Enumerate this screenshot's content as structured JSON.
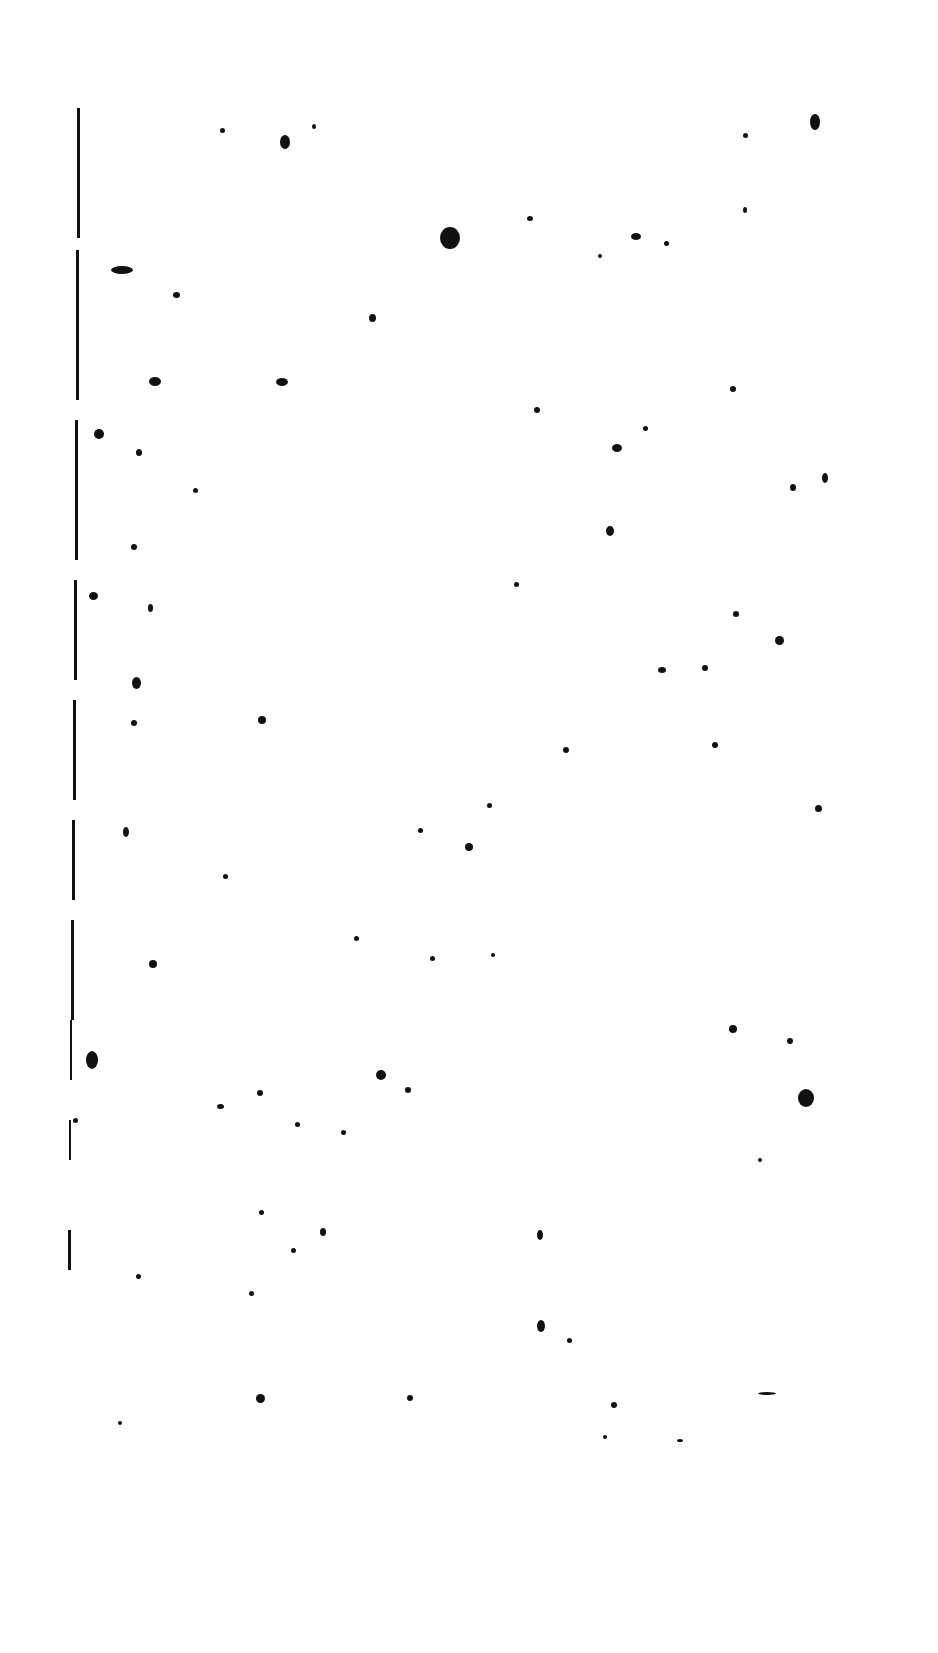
{
  "page": {
    "type": "blank scanned page",
    "text": "",
    "background": "#ffffff",
    "ink": "#111111"
  },
  "edge_segments": [
    [
      77,
      108,
      3,
      130
    ],
    [
      76,
      250,
      3,
      150
    ],
    [
      75,
      420,
      3,
      140
    ],
    [
      74,
      580,
      3,
      100
    ],
    [
      73,
      700,
      3,
      100
    ],
    [
      72,
      820,
      3,
      80
    ],
    [
      71,
      920,
      3,
      100
    ],
    [
      70,
      1020,
      2,
      60
    ],
    [
      69,
      1120,
      2,
      40
    ],
    [
      68,
      1230,
      3,
      40
    ]
  ],
  "dots": [
    [
      285,
      142,
      10,
      14
    ],
    [
      450,
      238,
      20,
      22
    ],
    [
      815,
      122,
      10,
      16
    ],
    [
      122,
      270,
      22,
      8
    ],
    [
      176,
      295,
      7,
      6
    ],
    [
      372,
      318,
      7,
      8
    ],
    [
      222,
      130,
      5,
      5
    ],
    [
      314,
      126,
      4,
      5
    ],
    [
      530,
      218,
      6,
      5
    ],
    [
      636,
      236,
      10,
      7
    ],
    [
      666,
      243,
      5,
      5
    ],
    [
      600,
      256,
      4,
      4
    ],
    [
      745,
      135,
      5,
      5
    ],
    [
      745,
      210,
      4,
      6
    ],
    [
      155,
      381,
      12,
      9
    ],
    [
      282,
      382,
      12,
      8
    ],
    [
      99,
      434,
      10,
      10
    ],
    [
      139,
      452,
      6,
      7
    ],
    [
      195,
      490,
      5,
      5
    ],
    [
      617,
      448,
      10,
      8
    ],
    [
      537,
      410,
      6,
      6
    ],
    [
      645,
      428,
      5,
      5
    ],
    [
      733,
      389,
      6,
      6
    ],
    [
      793,
      487,
      6,
      7
    ],
    [
      825,
      478,
      6,
      10
    ],
    [
      610,
      531,
      8,
      10
    ],
    [
      134,
      547,
      6,
      6
    ],
    [
      93,
      596,
      9,
      8
    ],
    [
      150,
      608,
      5,
      8
    ],
    [
      516,
      584,
      5,
      5
    ],
    [
      136,
      683,
      9,
      12
    ],
    [
      262,
      720,
      8,
      8
    ],
    [
      779,
      640,
      9,
      9
    ],
    [
      705,
      668,
      6,
      6
    ],
    [
      662,
      670,
      8,
      6
    ],
    [
      736,
      614,
      6,
      6
    ],
    [
      134,
      723,
      6,
      6
    ],
    [
      715,
      745,
      6,
      6
    ],
    [
      566,
      750,
      6,
      6
    ],
    [
      489,
      805,
      5,
      5
    ],
    [
      818,
      808,
      7,
      7
    ],
    [
      126,
      832,
      6,
      10
    ],
    [
      469,
      847,
      8,
      8
    ],
    [
      420,
      830,
      5,
      5
    ],
    [
      225,
      876,
      5,
      5
    ],
    [
      153,
      964,
      8,
      8
    ],
    [
      356,
      938,
      5,
      5
    ],
    [
      432,
      958,
      5,
      5
    ],
    [
      493,
      955,
      4,
      4
    ],
    [
      733,
      1029,
      8,
      8
    ],
    [
      790,
      1041,
      6,
      6
    ],
    [
      92,
      1060,
      12,
      18
    ],
    [
      381,
      1075,
      10,
      10
    ],
    [
      408,
      1090,
      6,
      6
    ],
    [
      806,
      1098,
      16,
      18
    ],
    [
      220,
      1106,
      7,
      5
    ],
    [
      75,
      1120,
      5,
      5
    ],
    [
      260,
      1093,
      6,
      6
    ],
    [
      297,
      1124,
      5,
      5
    ],
    [
      343,
      1132,
      5,
      5
    ],
    [
      323,
      1232,
      6,
      8
    ],
    [
      293,
      1250,
      5,
      5
    ],
    [
      261,
      1212,
      5,
      5
    ],
    [
      540,
      1235,
      6,
      10
    ],
    [
      541,
      1326,
      8,
      12
    ],
    [
      251,
      1293,
      5,
      5
    ],
    [
      138,
      1276,
      5,
      5
    ],
    [
      569,
      1340,
      5,
      5
    ],
    [
      260,
      1398,
      9,
      9
    ],
    [
      410,
      1398,
      6,
      6
    ],
    [
      614,
      1405,
      6,
      6
    ],
    [
      120,
      1423,
      4,
      4
    ],
    [
      767,
      1393,
      18,
      3
    ],
    [
      680,
      1440,
      6,
      3
    ],
    [
      605,
      1437,
      4,
      4
    ],
    [
      760,
      1160,
      4,
      4
    ]
  ]
}
